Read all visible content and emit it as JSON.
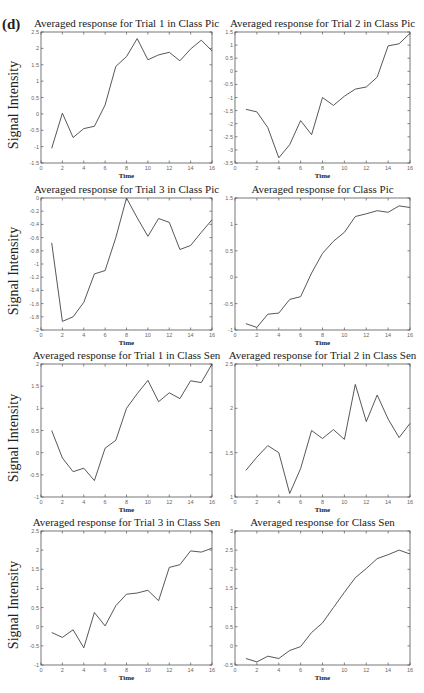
{
  "figure": {
    "panel_label": "(d)",
    "ylabel": "Signal Intensity",
    "xlabel": "Time"
  },
  "chart_data": [
    {
      "type": "line",
      "title": "Averaged response for Trial 1 in Class Pic",
      "xlabel": "Time",
      "ylabel": "Signal Intensity",
      "xlim": [
        0,
        16
      ],
      "ylim": [
        -1.5,
        2.5
      ],
      "xticks": [
        0,
        2,
        4,
        6,
        8,
        10,
        12,
        14,
        16
      ],
      "yticks": [
        -1.5,
        -1,
        -0.5,
        0,
        0.5,
        1,
        1.5,
        2,
        2.5
      ],
      "x": [
        1,
        2,
        3,
        4,
        5,
        6,
        7,
        8,
        9,
        10,
        11,
        12,
        13,
        14,
        15,
        16
      ],
      "values": [
        -1.05,
        0.02,
        -0.72,
        -0.45,
        -0.38,
        0.27,
        1.45,
        1.75,
        2.3,
        1.65,
        1.8,
        1.88,
        1.62,
        1.98,
        2.25,
        1.92
      ]
    },
    {
      "type": "line",
      "title": "Averaged response for Trial 2 in Class Pic",
      "xlabel": "Time",
      "ylabel": "",
      "xlim": [
        0,
        16
      ],
      "ylim": [
        -3.5,
        1.5
      ],
      "xticks": [
        0,
        2,
        4,
        6,
        8,
        10,
        12,
        14,
        16
      ],
      "yticks": [
        -3.5,
        -3,
        -2.5,
        -2,
        -1.5,
        -1,
        -0.5,
        0,
        0.5,
        1,
        1.5
      ],
      "x": [
        1,
        2,
        3,
        4,
        5,
        6,
        7,
        8,
        9,
        10,
        11,
        12,
        13,
        14,
        15,
        16
      ],
      "values": [
        -1.45,
        -1.55,
        -2.15,
        -3.3,
        -2.8,
        -1.88,
        -2.42,
        -1.0,
        -1.3,
        -0.95,
        -0.68,
        -0.6,
        -0.22,
        0.97,
        1.05,
        1.45
      ]
    },
    {
      "type": "line",
      "title": "Averaged response for Trial 3 in Class Pic",
      "xlabel": "Time",
      "ylabel": "Signal Intensity",
      "xlim": [
        0,
        16
      ],
      "ylim": [
        -2,
        0
      ],
      "xticks": [
        0,
        2,
        4,
        6,
        8,
        10,
        12,
        14,
        16
      ],
      "yticks": [
        -2,
        -1.8,
        -1.6,
        -1.4,
        -1.2,
        -1,
        -0.8,
        -0.6,
        -0.4,
        -0.2,
        0
      ],
      "x": [
        1,
        2,
        3,
        4,
        5,
        6,
        7,
        8,
        9,
        10,
        11,
        12,
        13,
        14,
        15,
        16
      ],
      "values": [
        -0.68,
        -1.87,
        -1.8,
        -1.58,
        -1.15,
        -1.1,
        -0.6,
        0.0,
        -0.3,
        -0.58,
        -0.31,
        -0.37,
        -0.78,
        -0.72,
        -0.52,
        -0.33
      ]
    },
    {
      "type": "line",
      "title": "Averaged response for Class Pic",
      "xlabel": "Time",
      "ylabel": "",
      "xlim": [
        0,
        16
      ],
      "ylim": [
        -1,
        1.5
      ],
      "xticks": [
        0,
        2,
        4,
        6,
        8,
        10,
        12,
        14,
        16
      ],
      "yticks": [
        -1,
        -0.5,
        0,
        0.5,
        1,
        1.5
      ],
      "x": [
        1,
        2,
        3,
        4,
        5,
        6,
        7,
        8,
        9,
        10,
        11,
        12,
        13,
        14,
        15,
        16
      ],
      "values": [
        -0.88,
        -0.95,
        -0.7,
        -0.68,
        -0.42,
        -0.37,
        0.08,
        0.45,
        0.68,
        0.85,
        1.15,
        1.2,
        1.26,
        1.23,
        1.35,
        1.32
      ]
    },
    {
      "type": "line",
      "title": "Averaged response for Trial 1 in Class Sen",
      "xlabel": "Time",
      "ylabel": "Signal Intensity",
      "xlim": [
        0,
        16
      ],
      "ylim": [
        -1,
        2
      ],
      "xticks": [
        0,
        2,
        4,
        6,
        8,
        10,
        12,
        14,
        16
      ],
      "yticks": [
        -1,
        -0.5,
        0,
        0.5,
        1,
        1.5,
        2
      ],
      "x": [
        1,
        2,
        3,
        4,
        5,
        6,
        7,
        8,
        9,
        10,
        11,
        12,
        13,
        14,
        15,
        16
      ],
      "values": [
        0.5,
        -0.12,
        -0.43,
        -0.35,
        -0.63,
        0.1,
        0.28,
        1.0,
        1.33,
        1.63,
        1.15,
        1.35,
        1.22,
        1.62,
        1.58,
        2.0
      ]
    },
    {
      "type": "line",
      "title": "Averaged response for Trial 2 in Class Sen",
      "xlabel": "Time",
      "ylabel": "",
      "xlim": [
        0,
        16
      ],
      "ylim": [
        1,
        2.5
      ],
      "xticks": [
        0,
        2,
        4,
        6,
        8,
        10,
        12,
        14,
        16
      ],
      "yticks": [
        1,
        1.5,
        2,
        2.5
      ],
      "x": [
        1,
        2,
        3,
        4,
        5,
        6,
        7,
        8,
        9,
        10,
        11,
        12,
        13,
        14,
        15,
        16
      ],
      "values": [
        1.3,
        1.45,
        1.58,
        1.5,
        1.04,
        1.32,
        1.75,
        1.66,
        1.76,
        1.65,
        2.27,
        1.85,
        2.15,
        1.88,
        1.67,
        1.83
      ]
    },
    {
      "type": "line",
      "title": "Averaged response for Trial 3 in Class Sen",
      "xlabel": "Time",
      "ylabel": "Signal Intensity",
      "xlim": [
        0,
        16
      ],
      "ylim": [
        -1,
        2.5
      ],
      "xticks": [
        0,
        2,
        4,
        6,
        8,
        10,
        12,
        14,
        16
      ],
      "yticks": [
        -1,
        -0.5,
        0,
        0.5,
        1,
        1.5,
        2,
        2.5
      ],
      "x": [
        1,
        2,
        3,
        4,
        5,
        6,
        7,
        8,
        9,
        10,
        11,
        12,
        13,
        14,
        15,
        16
      ],
      "values": [
        -0.15,
        -0.28,
        -0.08,
        -0.55,
        0.37,
        0.02,
        0.55,
        0.85,
        0.88,
        0.95,
        0.68,
        1.55,
        1.62,
        1.98,
        1.95,
        2.05
      ]
    },
    {
      "type": "line",
      "title": "Averaged response for Class Sen",
      "xlabel": "Time",
      "ylabel": "",
      "xlim": [
        0,
        16
      ],
      "ylim": [
        -0.5,
        3
      ],
      "xticks": [
        0,
        2,
        4,
        6,
        8,
        10,
        12,
        14,
        16
      ],
      "yticks": [
        -0.5,
        0,
        0.5,
        1,
        1.5,
        2,
        2.5,
        3
      ],
      "x": [
        1,
        2,
        3,
        4,
        5,
        6,
        7,
        8,
        9,
        10,
        11,
        12,
        13,
        14,
        15,
        16
      ],
      "values": [
        -0.33,
        -0.42,
        -0.27,
        -0.33,
        -0.12,
        -0.02,
        0.35,
        0.6,
        1.0,
        1.4,
        1.78,
        2.02,
        2.28,
        2.38,
        2.5,
        2.4
      ]
    }
  ]
}
